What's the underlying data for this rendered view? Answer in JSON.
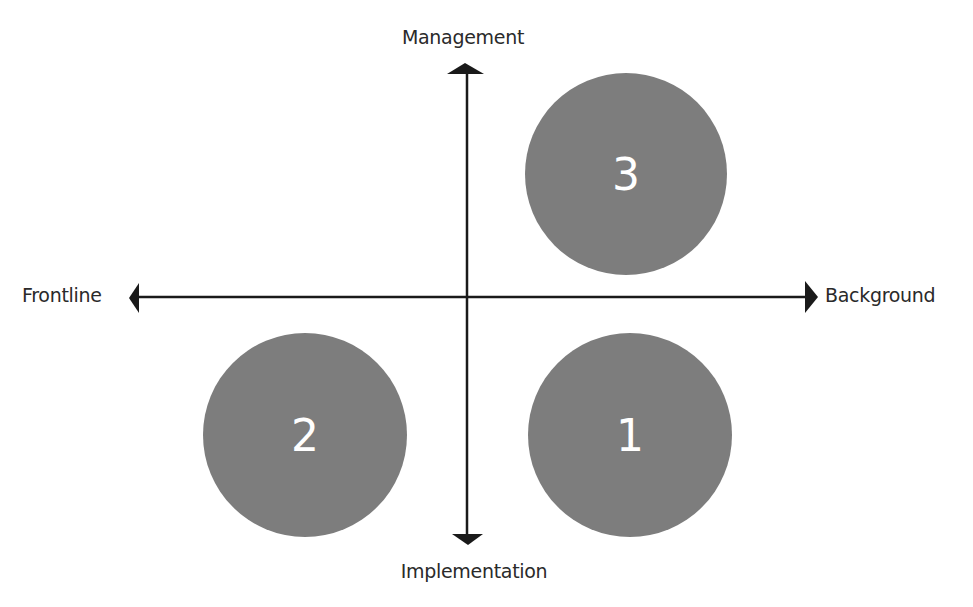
{
  "diagram": {
    "type": "quadrant",
    "axes": {
      "vertical": {
        "top_label": "Management",
        "bottom_label": "Implementation"
      },
      "horizontal": {
        "left_label": "Frontline",
        "right_label": "Background"
      }
    },
    "circles": [
      {
        "label": "3",
        "quadrant": "top-right"
      },
      {
        "label": "2",
        "quadrant": "bottom-left"
      },
      {
        "label": "1",
        "quadrant": "bottom-right"
      }
    ],
    "colors": {
      "circle_fill": "#7d7d7d",
      "circle_text": "#ffffff",
      "axis": "#1a1a1a",
      "label_text": "#2a2a2a"
    }
  }
}
